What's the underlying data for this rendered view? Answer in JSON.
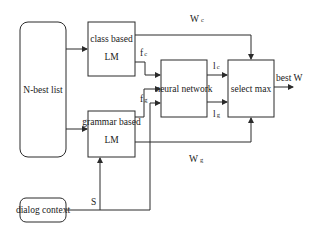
{
  "diagram": {
    "nodes": {
      "nbest": {
        "label": "N-best list"
      },
      "class_lm": {
        "line1": "class based",
        "line2": "LM"
      },
      "grammar_lm": {
        "line1": "grammar based",
        "line2": "LM"
      },
      "neural_network": {
        "label": "neural network"
      },
      "select_max": {
        "label": "select  max"
      },
      "dialog_context": {
        "label": "dialog context"
      }
    },
    "edges": {
      "wc": {
        "main": "W",
        "sub": "c"
      },
      "wg": {
        "main": "W",
        "sub": "g"
      },
      "fc": {
        "main": "f",
        "sub": "c"
      },
      "fg": {
        "main": "f",
        "sub": "g"
      },
      "lc": {
        "main": "l",
        "sub": "c"
      },
      "lg": {
        "main": "l",
        "sub": "g"
      },
      "s": {
        "label": "S"
      },
      "best_w": {
        "label": "best W"
      }
    },
    "colors": {
      "stroke": "#2b2b2b",
      "background": "#ffffff"
    }
  }
}
